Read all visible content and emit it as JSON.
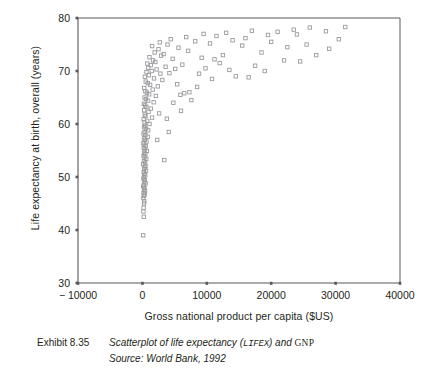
{
  "figure": {
    "caption_label": "Exhibit 8.35",
    "caption_line1_pre": "Scatterplot of life expectancy (",
    "caption_line1_code": "LIFEX",
    "caption_line1_mid": ") and ",
    "caption_line1_code2": "GNP",
    "caption_line2": "Source: World Bank, 1992"
  },
  "colors": {
    "axis": "#58585b",
    "marker_stroke": "#9a9a9e",
    "text": "#231f20",
    "background": "#ffffff"
  },
  "chart_data": {
    "type": "scatter",
    "title": "",
    "xlabel": "Gross national product per capita ($US)",
    "ylabel": "Life expectancy at birth, overall (years)",
    "xlim": [
      -10000,
      40000
    ],
    "ylim": [
      30,
      80
    ],
    "xticks": [
      -10000,
      0,
      10000,
      20000,
      30000,
      40000
    ],
    "xtick_labels": [
      "− 10000",
      "0",
      "10000",
      "20000",
      "30000",
      "40000"
    ],
    "yticks": [
      30,
      40,
      50,
      60,
      70,
      80
    ],
    "ytick_labels": [
      "30",
      "40",
      "50",
      "60",
      "70",
      "80"
    ],
    "grid": false,
    "legend": null,
    "marker": "open-square",
    "series": [
      {
        "name": "Countries",
        "points": [
          [
            120,
            39.0
          ],
          [
            210,
            42.5
          ],
          [
            160,
            43.5
          ],
          [
            190,
            44.2
          ],
          [
            250,
            45.0
          ],
          [
            300,
            45.4
          ],
          [
            150,
            46.0
          ],
          [
            230,
            46.4
          ],
          [
            350,
            46.7
          ],
          [
            180,
            47.0
          ],
          [
            400,
            47.3
          ],
          [
            260,
            47.6
          ],
          [
            320,
            47.9
          ],
          [
            140,
            48.2
          ],
          [
            220,
            48.5
          ],
          [
            500,
            48.8
          ],
          [
            290,
            49.1
          ],
          [
            380,
            49.4
          ],
          [
            170,
            49.7
          ],
          [
            240,
            50.0
          ],
          [
            430,
            50.3
          ],
          [
            310,
            50.6
          ],
          [
            200,
            50.9
          ],
          [
            560,
            51.2
          ],
          [
            270,
            51.5
          ],
          [
            340,
            51.8
          ],
          [
            480,
            52.1
          ],
          [
            130,
            52.4
          ],
          [
            410,
            52.7
          ],
          [
            230,
            53.0
          ],
          [
            3400,
            53.2
          ],
          [
            600,
            53.4
          ],
          [
            330,
            53.7
          ],
          [
            190,
            54.0
          ],
          [
            450,
            54.3
          ],
          [
            280,
            54.6
          ],
          [
            700,
            54.9
          ],
          [
            360,
            55.2
          ],
          [
            210,
            55.5
          ],
          [
            520,
            55.8
          ],
          [
            300,
            56.1
          ],
          [
            160,
            56.4
          ],
          [
            640,
            56.7
          ],
          [
            390,
            57.0
          ],
          [
            250,
            57.3
          ],
          [
            820,
            57.6
          ],
          [
            470,
            57.9
          ],
          [
            180,
            58.2
          ],
          [
            340,
            58.5
          ],
          [
            900,
            58.8
          ],
          [
            560,
            59.1
          ],
          [
            260,
            59.4
          ],
          [
            420,
            59.7
          ],
          [
            1100,
            60.0
          ],
          [
            310,
            60.3
          ],
          [
            740,
            60.6
          ],
          [
            200,
            60.9
          ],
          [
            1500,
            61.2
          ],
          [
            480,
            61.5
          ],
          [
            360,
            61.8
          ],
          [
            2600,
            62.0
          ],
          [
            950,
            62.3
          ],
          [
            280,
            62.6
          ],
          [
            1300,
            62.9
          ],
          [
            620,
            63.2
          ],
          [
            410,
            63.5
          ],
          [
            230,
            63.8
          ],
          [
            1750,
            64.1
          ],
          [
            880,
            64.4
          ],
          [
            540,
            64.7
          ],
          [
            7600,
            64.5
          ],
          [
            330,
            65.0
          ],
          [
            2100,
            65.3
          ],
          [
            1050,
            65.6
          ],
          [
            700,
            65.9
          ],
          [
            6500,
            65.8
          ],
          [
            450,
            66.2
          ],
          [
            1600,
            66.5
          ],
          [
            280,
            66.8
          ],
          [
            2400,
            67.1
          ],
          [
            1200,
            67.4
          ],
          [
            830,
            67.7
          ],
          [
            520,
            68.0
          ],
          [
            3100,
            68.3
          ],
          [
            1800,
            68.6
          ],
          [
            380,
            68.9
          ],
          [
            1000,
            69.2
          ],
          [
            2800,
            69.5
          ],
          [
            640,
            69.8
          ],
          [
            4200,
            69.6
          ],
          [
            1450,
            70.0
          ],
          [
            8800,
            69.5
          ],
          [
            2200,
            70.3
          ],
          [
            900,
            70.6
          ],
          [
            5100,
            70.4
          ],
          [
            3600,
            70.8
          ],
          [
            1300,
            71.1
          ],
          [
            760,
            71.4
          ],
          [
            2000,
            71.7
          ],
          [
            6200,
            71.2
          ],
          [
            1650,
            72.0
          ],
          [
            4700,
            72.3
          ],
          [
            1100,
            72.6
          ],
          [
            2900,
            72.9
          ],
          [
            9200,
            72.5
          ],
          [
            3300,
            73.2
          ],
          [
            1900,
            73.5
          ],
          [
            7100,
            73.8
          ],
          [
            2500,
            74.1
          ],
          [
            12500,
            73.0
          ],
          [
            5600,
            74.4
          ],
          [
            1500,
            74.7
          ],
          [
            3900,
            75.0
          ],
          [
            10500,
            75.2
          ],
          [
            2700,
            75.4
          ],
          [
            8200,
            75.6
          ],
          [
            14000,
            75.8
          ],
          [
            4400,
            76.0
          ],
          [
            16000,
            76.2
          ],
          [
            6800,
            76.4
          ],
          [
            11500,
            76.6
          ],
          [
            19500,
            76.8
          ],
          [
            9500,
            77.0
          ],
          [
            13000,
            77.2
          ],
          [
            21000,
            77.4
          ],
          [
            17000,
            77.6
          ],
          [
            23500,
            77.8
          ],
          [
            26000,
            78.2
          ],
          [
            28500,
            77.5
          ],
          [
            31500,
            78.3
          ],
          [
            24000,
            76.9
          ],
          [
            20000,
            75.5
          ],
          [
            15500,
            74.8
          ],
          [
            18500,
            73.5
          ],
          [
            22500,
            74.5
          ],
          [
            25500,
            75.0
          ],
          [
            29000,
            74.2
          ],
          [
            27000,
            73.0
          ],
          [
            12000,
            71.5
          ],
          [
            14500,
            69.0
          ],
          [
            16500,
            68.8
          ],
          [
            10800,
            68.5
          ],
          [
            8500,
            67.0
          ],
          [
            7300,
            66.0
          ],
          [
            5900,
            65.5
          ],
          [
            4800,
            64.0
          ],
          [
            6000,
            62.5
          ],
          [
            3800,
            61.0
          ],
          [
            4100,
            58.5
          ],
          [
            2300,
            57.0
          ],
          [
            5400,
            67.5
          ],
          [
            9800,
            70.5
          ],
          [
            11200,
            72.2
          ],
          [
            13500,
            70.2
          ],
          [
            30500,
            76.0
          ],
          [
            22000,
            72.0
          ],
          [
            19000,
            70.0
          ],
          [
            17500,
            71.0
          ],
          [
            24500,
            71.8
          ]
        ]
      }
    ]
  }
}
